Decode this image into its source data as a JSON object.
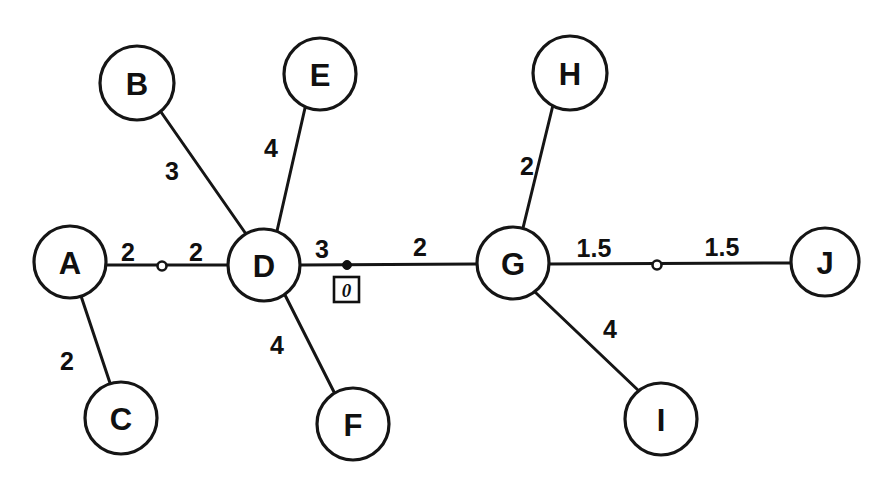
{
  "diagram": {
    "background_color": "#ffffff",
    "stroke_color": "#151515",
    "text_color": "#101010",
    "node_radius": 36,
    "nodes": [
      {
        "id": "A",
        "label": "A",
        "cx": 70,
        "cy": 262,
        "r": 36
      },
      {
        "id": "B",
        "label": "B",
        "cx": 137,
        "cy": 83,
        "r": 37
      },
      {
        "id": "C",
        "label": "C",
        "cx": 121,
        "cy": 418,
        "r": 36
      },
      {
        "id": "D",
        "label": "D",
        "cx": 264,
        "cy": 265,
        "r": 36
      },
      {
        "id": "E",
        "label": "E",
        "cx": 320,
        "cy": 74,
        "r": 36
      },
      {
        "id": "F",
        "label": "F",
        "cx": 353,
        "cy": 424,
        "r": 36
      },
      {
        "id": "G",
        "label": "G",
        "cx": 513,
        "cy": 263,
        "r": 36
      },
      {
        "id": "H",
        "label": "H",
        "cx": 570,
        "cy": 73,
        "r": 37
      },
      {
        "id": "I",
        "label": "I",
        "cx": 661,
        "cy": 419,
        "r": 36
      },
      {
        "id": "J",
        "label": "J",
        "cx": 825,
        "cy": 262,
        "r": 34
      }
    ],
    "edges": [
      {
        "id": "A-C",
        "from": "A",
        "to": "C",
        "weight": "2",
        "wx": 67,
        "wy": 361
      },
      {
        "id": "B-D",
        "from": "B",
        "to": "D",
        "weight": "3",
        "wx": 172,
        "wy": 171
      },
      {
        "id": "E-D",
        "from": "E",
        "to": "D",
        "weight": "4",
        "wx": 271,
        "wy": 148
      },
      {
        "id": "D-F",
        "from": "D",
        "to": "F",
        "weight": "4",
        "wx": 277,
        "wy": 345
      },
      {
        "id": "H-G",
        "from": "H",
        "to": "G",
        "weight": "2",
        "wx": 527,
        "wy": 166
      },
      {
        "id": "G-I",
        "from": "G",
        "to": "I",
        "weight": "4",
        "wx": 610,
        "wy": 329
      },
      {
        "id": "A-D",
        "from": "A",
        "to": "D",
        "weight_left": "2",
        "weight_right": "2",
        "wlx": 128,
        "wly": 252,
        "wrx": 196,
        "wry": 252
      },
      {
        "id": "D-G",
        "from": "D",
        "to": "G",
        "weight_near": "3",
        "weight_far": "2",
        "wnx": 322,
        "wny": 249,
        "wfx": 420,
        "wfy": 247
      },
      {
        "id": "G-J",
        "from": "G",
        "to": "J",
        "weight_left": "1.5",
        "weight_right": "1.5",
        "wlx": 594,
        "wly": 248,
        "wrx": 722,
        "wry": 247
      }
    ],
    "midpoints": [
      {
        "id": "midpoint-a-d",
        "kind": "hollow",
        "cx": 162,
        "cy": 266,
        "r": 4.5
      },
      {
        "id": "midpoint-g-j",
        "kind": "hollow",
        "cx": 657,
        "cy": 265,
        "r": 4.5
      },
      {
        "id": "marker-point-d-g",
        "kind": "filled",
        "cx": 347,
        "cy": 265,
        "r": 4.5
      }
    ],
    "markers": [
      {
        "id": "zero-marker",
        "label": "0",
        "box_x": 334,
        "box_y": 277,
        "box_w": 25,
        "box_h": 25
      }
    ]
  }
}
